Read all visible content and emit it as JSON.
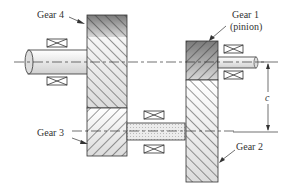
{
  "diagram": {
    "type": "compound gear train (reverted) cross-section",
    "labels": {
      "gear4": "Gear 4",
      "gear1_line1": "Gear 1",
      "gear1_line2": "(pinion)",
      "gear3": "Gear 3",
      "gear2": "Gear 2",
      "dimension": "c"
    },
    "components": [
      {
        "name": "Gear 1",
        "note": "pinion on output-side shaft, upper right"
      },
      {
        "name": "Gear 2",
        "note": "lower right, on countershaft"
      },
      {
        "name": "Gear 3",
        "note": "lower left, on countershaft"
      },
      {
        "name": "Gear 4",
        "note": "upper left, on input shaft"
      }
    ],
    "dimension": "c = center distance between the two shaft axes",
    "colors": {
      "line": "#333333",
      "hatch": "#444444",
      "dark_fill": "#8a8a8a",
      "light_fill": "#e6e6e6",
      "shaft_fill": "#eeeeee"
    }
  }
}
